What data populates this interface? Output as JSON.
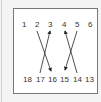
{
  "diagram": {
    "top_row": [
      "1",
      "2",
      "3",
      "4",
      "5",
      "6"
    ],
    "bottom_row": [
      "18",
      "17",
      "16",
      "15",
      "14",
      "13"
    ],
    "arrows": [
      {
        "from": "2",
        "to": "16"
      },
      {
        "from": "17",
        "to": "3"
      },
      {
        "from": "5",
        "to": "15"
      },
      {
        "from": "14",
        "to": "4"
      }
    ]
  }
}
